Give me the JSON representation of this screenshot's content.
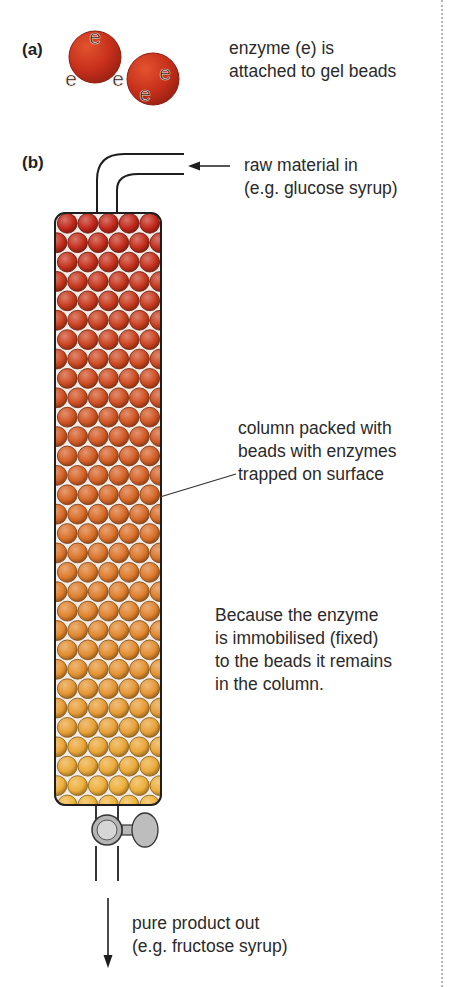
{
  "part_a": {
    "label": "(a)",
    "caption_lines": [
      "enzyme (e) is",
      "attached to gel beads"
    ],
    "enzyme_symbol": "e",
    "beads": [
      {
        "cx": 95,
        "cy": 57,
        "r": 26,
        "enzymes": [
          {
            "x": 95,
            "y": 36
          },
          {
            "x": 71,
            "y": 78
          },
          {
            "x": 118,
            "y": 78
          }
        ]
      },
      {
        "cx": 153,
        "cy": 79,
        "r": 26,
        "enzymes": [
          {
            "x": 165,
            "y": 72
          },
          {
            "x": 145,
            "y": 93
          }
        ]
      }
    ],
    "bead_color": "#c7301b"
  },
  "part_b": {
    "label": "(b)",
    "inlet_label_lines": [
      "raw material in",
      "(e.g. glucose syrup)"
    ],
    "column_label_lines": [
      "column packed with",
      "beads with enzymes",
      "trapped on surface"
    ],
    "explanation_lines": [
      "Because the enzyme",
      "is immobilised (fixed)",
      "to the beads it remains",
      "in the column."
    ],
    "outlet_label_lines": [
      "pure product out",
      "(e.g. fructose syrup)"
    ],
    "column": {
      "x": 55,
      "y": 213,
      "width": 106,
      "height": 592,
      "bead_radius": 10.3,
      "rows": 30
    },
    "gradient_colors": {
      "top": "#c1261a",
      "middle": "#d86a27",
      "bottom": "#eeb33a"
    },
    "valve_color": "#c4c4c4",
    "icons": {
      "inlet_arrow": "arrow-left-icon",
      "outlet_arrow": "arrow-down-icon",
      "valve": "tap-valve-icon"
    }
  }
}
